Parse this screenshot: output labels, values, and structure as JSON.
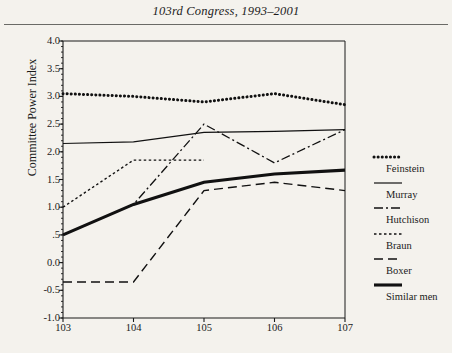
{
  "chart_data": {
    "type": "line",
    "title": "103rd Congress, 1993–2001",
    "xlabel": "",
    "ylabel": "Committee Power Index",
    "categories": [
      "103",
      "104",
      "105",
      "106",
      "107"
    ],
    "x": [
      103,
      104,
      105,
      106,
      107
    ],
    "xlim": [
      103,
      107
    ],
    "ylim": [
      -1.0,
      4.0
    ],
    "yticks": [
      "4.0",
      "3.5",
      "3.0",
      "2.5",
      "2.0",
      "1.5",
      "1.0",
      ".5",
      "0.0",
      "-0.5",
      "-1.0"
    ],
    "ytick_values": [
      4.0,
      3.5,
      3.0,
      2.5,
      2.0,
      1.5,
      1.0,
      0.5,
      0.0,
      -0.5,
      -1.0
    ],
    "grid": false,
    "legend_position": "right",
    "series": [
      {
        "name": "Feinstein",
        "style": "dotted",
        "values": [
          3.05,
          3.0,
          2.9,
          3.05,
          2.85
        ]
      },
      {
        "name": "Murray",
        "style": "solid-thin",
        "values": [
          2.15,
          2.18,
          2.35,
          2.37,
          2.4
        ]
      },
      {
        "name": "Hutchison",
        "style": "dash-dot",
        "values": [
          0.5,
          1.05,
          2.5,
          1.8,
          2.4
        ]
      },
      {
        "name": "Braun",
        "style": "fine-dash",
        "values": [
          1.0,
          1.85,
          1.85,
          null,
          null
        ]
      },
      {
        "name": "Boxer",
        "style": "long-dash",
        "values": [
          -0.35,
          -0.35,
          1.3,
          1.45,
          1.3
        ]
      },
      {
        "name": "Similar men",
        "style": "solid-thick",
        "values": [
          0.5,
          1.05,
          1.45,
          1.6,
          1.67
        ]
      }
    ]
  },
  "legend": {
    "items": [
      {
        "label": "Feinstein"
      },
      {
        "label": "Murray"
      },
      {
        "label": "Hutchison"
      },
      {
        "label": "Braun"
      },
      {
        "label": "Boxer"
      },
      {
        "label": "Similar men"
      }
    ]
  }
}
